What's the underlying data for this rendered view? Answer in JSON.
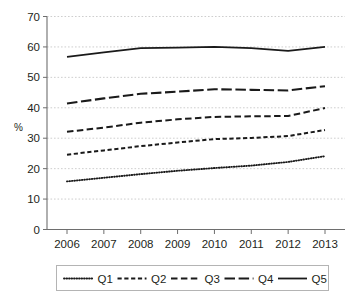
{
  "chart_data": {
    "type": "line",
    "title": "",
    "xlabel": "",
    "ylabel": "%",
    "x": [
      2006,
      2007,
      2008,
      2009,
      2010,
      2011,
      2012,
      2013
    ],
    "categories": [
      "2006",
      "2007",
      "2008",
      "2009",
      "2010",
      "2011",
      "2012",
      "2013"
    ],
    "ylim": [
      0,
      70
    ],
    "yticks": [
      0,
      10,
      20,
      30,
      40,
      50,
      60,
      70
    ],
    "ytick_labels": [
      "0",
      "10",
      "20",
      "30",
      "40",
      "50",
      "60",
      "70"
    ],
    "grid": true,
    "legend_position": "bottom",
    "series": [
      {
        "name": "Q1",
        "style": "dotted",
        "values": [
          15.8,
          17.0,
          18.2,
          19.3,
          20.2,
          21.0,
          22.2,
          24.1
        ]
      },
      {
        "name": "Q2",
        "style": "short-dash",
        "values": [
          24.6,
          26.0,
          27.4,
          28.6,
          29.7,
          30.1,
          30.7,
          32.7
        ]
      },
      {
        "name": "Q3",
        "style": "medium-dash",
        "values": [
          32.1,
          33.5,
          35.1,
          36.2,
          37.0,
          37.2,
          37.3,
          39.9
        ]
      },
      {
        "name": "Q4",
        "style": "long-dash",
        "values": [
          41.4,
          43.1,
          44.6,
          45.3,
          46.1,
          45.9,
          45.7,
          47.1
        ]
      },
      {
        "name": "Q5",
        "style": "solid",
        "values": [
          56.7,
          58.2,
          59.6,
          59.8,
          60.0,
          59.6,
          58.7,
          60.0
        ]
      }
    ]
  },
  "axis": {
    "y_title": "%"
  },
  "legend": {
    "items": [
      {
        "label": "Q1"
      },
      {
        "label": "Q2"
      },
      {
        "label": "Q3"
      },
      {
        "label": "Q4"
      },
      {
        "label": "Q5"
      }
    ]
  },
  "colors": {
    "line": "#1a1a1a",
    "grid": "#c8c8c8",
    "axis": "#6e6e6e",
    "legend_border": "#b4b4b4",
    "background": "#ffffff",
    "text": "#231f20"
  }
}
